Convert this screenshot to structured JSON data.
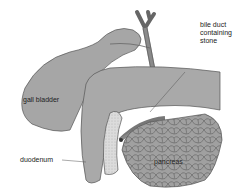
{
  "figure": {
    "type": "anatomical-illustration",
    "colors": {
      "organ_fill": "#a8a8a8",
      "organ_dark": "#8a8a8a",
      "duodenum_wall": "#d6d6d6",
      "outline": "#555555",
      "background": "#ffffff"
    }
  },
  "labels": {
    "bile_duct": "bile duct containing stone",
    "bile_duct_lines": [
      "bile duct",
      "containing",
      "stone"
    ],
    "gall_bladder": "gall bladder",
    "duodenum": "duodenum",
    "pancreas": "pancreas"
  }
}
